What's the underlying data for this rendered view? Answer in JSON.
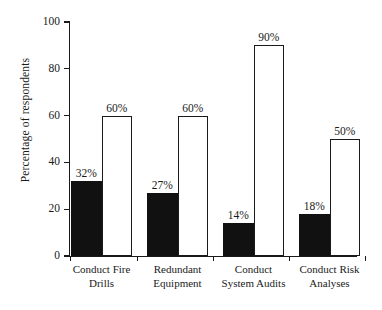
{
  "chart_data": {
    "type": "bar",
    "title": "",
    "subtitle": "",
    "xlabel": "",
    "ylabel": "Percentage of respondents",
    "ylim": [
      0,
      100
    ],
    "yticks": [
      0,
      20,
      40,
      60,
      80,
      100
    ],
    "ytick_labels": [
      "0",
      "20",
      "40",
      "60",
      "80",
      "100"
    ],
    "grid": false,
    "legend": "none",
    "categories": [
      "Conduct Fire Drills",
      "Redundant Equipment",
      "Conduct System Audits",
      "Conduct Risk Analyses"
    ],
    "category_lines": [
      [
        "Conduct Fire",
        "Drills"
      ],
      [
        "Redundant",
        "Equipment"
      ],
      [
        "Conduct",
        "System Audits"
      ],
      [
        "Conduct Risk",
        "Analyses"
      ]
    ],
    "series": [
      {
        "name": "filled",
        "style": "solid-black",
        "color": "#111111",
        "values": [
          32,
          27,
          14,
          18
        ],
        "labels": [
          "32%",
          "27%",
          "14%",
          "18%"
        ]
      },
      {
        "name": "open",
        "style": "white-outline",
        "color": "#ffffff",
        "edge_color": "#1a1a1a",
        "values": [
          60,
          60,
          90,
          50
        ],
        "labels": [
          "60%",
          "60%",
          "90%",
          "50%"
        ]
      }
    ],
    "axis_color": "#1a1a1a",
    "background_color": "#ffffff"
  }
}
